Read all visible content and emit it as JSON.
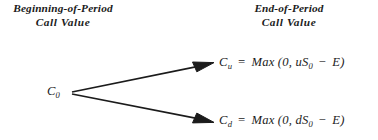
{
  "figure": {
    "type": "binomial-option-tree",
    "background_color": "#ffffff",
    "ink_color": "#1b1b1b"
  },
  "headers": {
    "left": {
      "line1": "Beginning-of-Period",
      "line2": "Call Value"
    },
    "right": {
      "line1": "End-of-Period",
      "line2": "Call Value"
    }
  },
  "nodes": {
    "root": {
      "symbol": "C",
      "subscript": "0",
      "full_text": "C0"
    },
    "up": {
      "symbol": "C",
      "subscript": "u",
      "equals": "=",
      "function": "Max",
      "open_paren": "(",
      "arg1": "0",
      "comma": ",",
      "arg2_coef": "uS",
      "arg2_subscript": "0",
      "minus": "−",
      "arg2_strike": "E",
      "close_paren": ")",
      "full_text": "Cu = Max (0, uS0 − E)"
    },
    "down": {
      "symbol": "C",
      "subscript": "d",
      "equals": "=",
      "function": "Max",
      "open_paren": "(",
      "arg1": "0",
      "comma": ",",
      "arg2_coef": "dS",
      "arg2_subscript": "0",
      "minus": "−",
      "arg2_strike": "E",
      "close_paren": ")",
      "full_text": "Cd = Max (0, dS0 − E)"
    }
  },
  "edges": [
    {
      "name": "up-branch",
      "from": [
        72,
        92
      ],
      "to": [
        213,
        63
      ]
    },
    {
      "name": "down-branch",
      "from": [
        72,
        94
      ],
      "to": [
        213,
        122
      ]
    }
  ]
}
